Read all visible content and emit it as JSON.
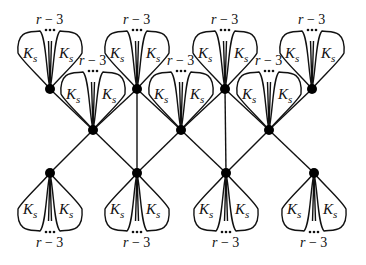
{
  "diagram": {
    "petal_label_main": "K",
    "petal_label_sub": "s",
    "count_label_var": "r",
    "count_label_rest": " − 3",
    "colors": {
      "stroke": "#111111",
      "node": "#000000",
      "background": "#ffffff"
    },
    "nodes": {
      "top": [
        [
          50,
          89
        ],
        [
          137,
          89
        ],
        [
          225,
          89
        ],
        [
          312,
          89
        ]
      ],
      "middle": [
        [
          93,
          130
        ],
        [
          181,
          130
        ],
        [
          269,
          130
        ]
      ],
      "bottom": [
        [
          50,
          173
        ],
        [
          137,
          173
        ],
        [
          226,
          173
        ],
        [
          314,
          173
        ]
      ]
    },
    "edges": [
      [
        [
          50,
          89
        ],
        [
          93,
          130
        ]
      ],
      [
        [
          137,
          89
        ],
        [
          93,
          130
        ]
      ],
      [
        [
          137,
          89
        ],
        [
          181,
          130
        ]
      ],
      [
        [
          225,
          89
        ],
        [
          181,
          130
        ]
      ],
      [
        [
          225,
          89
        ],
        [
          269,
          130
        ]
      ],
      [
        [
          312,
          89
        ],
        [
          269,
          130
        ]
      ],
      [
        [
          93,
          130
        ],
        [
          50,
          173
        ]
      ],
      [
        [
          93,
          130
        ],
        [
          137,
          173
        ]
      ],
      [
        [
          181,
          130
        ],
        [
          137,
          173
        ]
      ],
      [
        [
          181,
          130
        ],
        [
          226,
          173
        ]
      ],
      [
        [
          269,
          130
        ],
        [
          226,
          173
        ]
      ],
      [
        [
          269,
          130
        ],
        [
          314,
          173
        ]
      ],
      [
        [
          137,
          89
        ],
        [
          137,
          173
        ]
      ],
      [
        [
          225,
          89
        ],
        [
          226,
          173
        ]
      ]
    ],
    "clusters": [
      {
        "anchor": "top-1",
        "direction": "up"
      },
      {
        "anchor": "top-2",
        "direction": "up"
      },
      {
        "anchor": "top-3",
        "direction": "up"
      },
      {
        "anchor": "top-4",
        "direction": "up"
      },
      {
        "anchor": "middle-1",
        "direction": "up"
      },
      {
        "anchor": "middle-2",
        "direction": "up"
      },
      {
        "anchor": "middle-3",
        "direction": "up"
      },
      {
        "anchor": "bottom-1",
        "direction": "down"
      },
      {
        "anchor": "bottom-2",
        "direction": "down"
      },
      {
        "anchor": "bottom-3",
        "direction": "down"
      },
      {
        "anchor": "bottom-4",
        "direction": "down"
      }
    ]
  }
}
